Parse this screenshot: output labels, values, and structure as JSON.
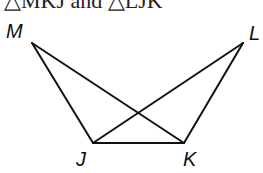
{
  "caption": "△MKJ and △LJK",
  "diagram": {
    "points": {
      "M": {
        "label": "M",
        "x": 32,
        "y": 43
      },
      "L": {
        "label": "L",
        "x": 243,
        "y": 43
      },
      "J": {
        "label": "J",
        "x": 93,
        "y": 143
      },
      "K": {
        "label": "K",
        "x": 184,
        "y": 143
      }
    },
    "segments": [
      "MJ",
      "MK",
      "LJ",
      "LK",
      "JK"
    ],
    "stroke_color": "#111111"
  }
}
